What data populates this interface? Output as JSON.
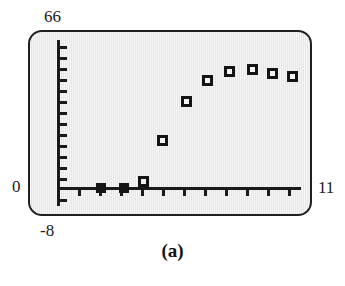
{
  "figure": {
    "caption": "(a)",
    "panel_border_color": "#231f20",
    "panel_fill_color": "#e9e9e9",
    "axis_color": "#1a1a1a",
    "marker_color": "#141414"
  },
  "chart_data": {
    "type": "scatter",
    "title": "",
    "subtitle": "",
    "caption": "(a)",
    "xlabel": "",
    "ylabel": "",
    "xlim": [
      -8,
      11
    ],
    "ylim": [
      0,
      66
    ],
    "x_min_label": "-8",
    "x_max_label": "11",
    "y_min_label": "0",
    "y_max_label": "66",
    "grid": false,
    "legend": "none",
    "x_tick_count": 13,
    "y_tick_count": 13,
    "x_tick_step": 1.5,
    "y_tick_step": 5,
    "marker_shape": "square",
    "points": [
      {
        "x": -4.0,
        "y": 0,
        "style": "filled"
      },
      {
        "x": -2.5,
        "y": 0,
        "style": "filled"
      },
      {
        "x": -1.2,
        "y": 2,
        "style": "open"
      },
      {
        "x": 0.5,
        "y": 14,
        "style": "open"
      },
      {
        "x": 2.0,
        "y": 26,
        "style": "open"
      },
      {
        "x": 3.5,
        "y": 39,
        "style": "open"
      },
      {
        "x": 4.8,
        "y": 44,
        "style": "open"
      },
      {
        "x": 6.2,
        "y": 47,
        "style": "open"
      },
      {
        "x": 7.6,
        "y": 46,
        "style": "open"
      },
      {
        "x": 9.0,
        "y": 43,
        "style": "open"
      }
    ],
    "series": [
      {
        "name": "series-1",
        "x": [
          -4.0,
          -2.5,
          -1.2,
          0.5,
          2.0,
          3.5,
          4.8,
          6.2,
          7.6,
          9.0
        ],
        "values": [
          0,
          0,
          2,
          14,
          26,
          39,
          44,
          47,
          46,
          43
        ]
      }
    ]
  },
  "geometry": {
    "panel": {
      "left": 28,
      "top": 30,
      "width": 284,
      "height": 186
    },
    "axis_origin_x": 57,
    "axis_origin_y": 188,
    "axis_top_y": 40,
    "axis_bottom_y": 206,
    "axis_right_x": 301,
    "y_tick_positions": [
      46,
      57,
      68,
      79,
      90,
      101,
      112,
      123,
      134,
      145,
      156,
      167,
      178,
      199
    ],
    "x_tick_positions": [
      78,
      99,
      120,
      141,
      162,
      183,
      204,
      225,
      246,
      267,
      288
    ],
    "pixel_points": [
      {
        "px": 101,
        "py": 188,
        "style": "filled"
      },
      {
        "px": 124,
        "py": 188,
        "style": "filled"
      },
      {
        "px": 143,
        "py": 181,
        "style": "open"
      },
      {
        "px": 162,
        "py": 140,
        "style": "open"
      },
      {
        "px": 186,
        "py": 101,
        "style": "open"
      },
      {
        "px": 207,
        "py": 80,
        "style": "open"
      },
      {
        "px": 229,
        "py": 71,
        "style": "open"
      },
      {
        "px": 252,
        "py": 69,
        "style": "open"
      },
      {
        "px": 272,
        "py": 73,
        "style": "open"
      },
      {
        "px": 292,
        "py": 76,
        "style": "open"
      }
    ]
  }
}
